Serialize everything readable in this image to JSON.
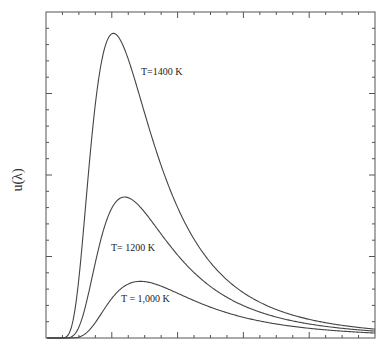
{
  "chart_data": {
    "type": "line",
    "title": "",
    "xlabel": "",
    "ylabel": "u(λ)",
    "grid": false,
    "legend": "inline labels",
    "xlim": [
      0,
      10.1
    ],
    "ylim": [
      0,
      1.07
    ],
    "x_tick_minor_count": 20,
    "x_tick_major_every": 4,
    "y_tick_minor_count": 20,
    "y_tick_major_every": 5,
    "tick_labels_shown": false,
    "series": [
      {
        "name": "T=1400 K",
        "temperature_K": 1400,
        "peak_x_um": 2.07,
        "peak_y": 1.0,
        "label_pos": [
          141,
          66
        ]
      },
      {
        "name": "T= 1200 K",
        "temperature_K": 1200,
        "peak_x_um": 2.41,
        "peak_y": 0.463,
        "label_pos": [
          111,
          242
        ]
      },
      {
        "name": "T = 1,000 K",
        "temperature_K": 1000,
        "peak_x_um": 2.9,
        "peak_y": 0.186,
        "label_pos": [
          121,
          293
        ]
      }
    ],
    "line_color": "#444444"
  },
  "axes": {
    "y_axis_label": "u(λ)"
  }
}
